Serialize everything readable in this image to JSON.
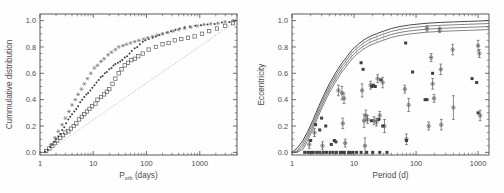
{
  "figure": {
    "background": "#fefefe",
    "panels": [
      "left",
      "right"
    ]
  },
  "chart_data": [
    {
      "type": "line",
      "panel": "left",
      "title": "",
      "xlabel": "P",
      "xlabel_sub": "orb",
      "xlabel_unit": " (days)",
      "xlabel_full": "P_orb (days)",
      "ylabel": "Cummulative distribution",
      "xscale": "log",
      "yscale": "linear",
      "xlim": [
        1,
        5000
      ],
      "ylim": [
        -0.02,
        1.05
      ],
      "xticks": [
        1,
        10,
        100,
        1000
      ],
      "xticklabels": [
        "1",
        "10",
        "100",
        "1000"
      ],
      "yticks": [
        0.0,
        0.2,
        0.4,
        0.6,
        0.8,
        1.0
      ],
      "yticklabels": [
        "0.0",
        "0.2",
        "0.4",
        "0.6",
        "0.8",
        "1.0"
      ],
      "grid": false,
      "legend": "none",
      "annotations": [
        "dotted diagonal reference line from (1.3, 0.0) to (5000, 1.0)"
      ],
      "series": [
        {
          "name": "open-squares",
          "marker": "square-open",
          "x": [
            1.3,
            1.5,
            1.7,
            1.9,
            2.1,
            2.4,
            2.7,
            3.0,
            3.4,
            3.8,
            4.3,
            4.8,
            5.4,
            6.1,
            6.8,
            7.6,
            8.5,
            9.5,
            11,
            12,
            14,
            16,
            18,
            20,
            23,
            26,
            30,
            34,
            39,
            45,
            52,
            60,
            70,
            85,
            110,
            150,
            200,
            260,
            340,
            450,
            600,
            800,
            1100,
            1500,
            2100,
            3000,
            4200
          ],
          "y": [
            0.01,
            0.03,
            0.05,
            0.07,
            0.09,
            0.11,
            0.13,
            0.15,
            0.16,
            0.18,
            0.2,
            0.22,
            0.25,
            0.27,
            0.29,
            0.31,
            0.33,
            0.35,
            0.37,
            0.4,
            0.42,
            0.44,
            0.46,
            0.48,
            0.52,
            0.56,
            0.6,
            0.63,
            0.66,
            0.68,
            0.7,
            0.71,
            0.73,
            0.75,
            0.78,
            0.8,
            0.82,
            0.83,
            0.85,
            0.86,
            0.87,
            0.88,
            0.9,
            0.92,
            0.94,
            0.96,
            0.98
          ]
        },
        {
          "name": "filled-dots",
          "marker": "dot",
          "x": [
            1.25,
            1.4,
            1.55,
            1.7,
            1.85,
            2.0,
            2.2,
            2.4,
            2.6,
            2.85,
            3.1,
            3.4,
            3.7,
            4.0,
            4.4,
            4.8,
            5.2,
            5.7,
            6.2,
            6.8,
            7.4,
            8.0,
            8.8,
            9.6,
            10.5,
            11.5,
            12.6,
            13.8,
            15,
            16.5,
            18,
            20,
            22,
            24,
            26,
            29,
            32,
            35,
            39,
            43,
            48,
            53,
            60,
            67,
            75,
            85,
            95,
            110,
            130,
            150,
            175,
            200,
            240,
            290,
            350,
            420,
            520,
            650,
            820,
            1050,
            1400,
            1900,
            2600,
            3600,
            4600
          ],
          "y": [
            0.005,
            0.02,
            0.04,
            0.06,
            0.08,
            0.1,
            0.12,
            0.14,
            0.17,
            0.19,
            0.22,
            0.25,
            0.27,
            0.29,
            0.31,
            0.33,
            0.35,
            0.38,
            0.4,
            0.42,
            0.44,
            0.45,
            0.47,
            0.49,
            0.51,
            0.53,
            0.55,
            0.57,
            0.58,
            0.6,
            0.61,
            0.63,
            0.64,
            0.66,
            0.67,
            0.68,
            0.69,
            0.7,
            0.72,
            0.73,
            0.75,
            0.77,
            0.79,
            0.8,
            0.82,
            0.84,
            0.85,
            0.86,
            0.87,
            0.88,
            0.89,
            0.9,
            0.91,
            0.92,
            0.93,
            0.94,
            0.95,
            0.955,
            0.96,
            0.965,
            0.97,
            0.975,
            0.985,
            0.99,
            1.0
          ]
        },
        {
          "name": "stars",
          "marker": "star",
          "x": [
            1.6,
            1.9,
            2.2,
            2.6,
            3.0,
            3.5,
            4.0,
            4.6,
            5.2,
            6.0,
            6.8,
            7.8,
            9.0,
            10.5,
            12,
            14,
            16,
            19,
            22,
            26,
            30,
            36,
            42,
            50,
            60,
            72,
            88,
            105,
            130,
            160,
            200,
            250,
            320,
            400,
            520,
            680,
            900,
            1200,
            1600,
            2200,
            3000,
            4200
          ],
          "y": [
            0.06,
            0.11,
            0.16,
            0.21,
            0.26,
            0.31,
            0.36,
            0.4,
            0.44,
            0.48,
            0.52,
            0.56,
            0.6,
            0.64,
            0.66,
            0.69,
            0.71,
            0.74,
            0.76,
            0.78,
            0.8,
            0.81,
            0.82,
            0.83,
            0.84,
            0.85,
            0.86,
            0.87,
            0.88,
            0.89,
            0.9,
            0.91,
            0.92,
            0.93,
            0.94,
            0.95,
            0.96,
            0.97,
            0.975,
            0.98,
            0.99,
            1.0
          ]
        }
      ]
    },
    {
      "type": "scatter",
      "panel": "right",
      "title": "",
      "xlabel": "Period (d)",
      "ylabel": "Eccentricity",
      "xscale": "log",
      "yscale": "linear",
      "xlim": [
        1,
        1500
      ],
      "ylim": [
        -0.02,
        1.05
      ],
      "xticks": [
        1,
        10,
        100,
        1000
      ],
      "xticklabels": [
        "1",
        "10",
        "100",
        "1000"
      ],
      "yticks": [
        0.0,
        0.2,
        0.4,
        0.6,
        0.8,
        1.0
      ],
      "yticklabels": [
        "0.0",
        "0.2",
        "0.4",
        "0.6",
        "0.8",
        "1.0"
      ],
      "grid": false,
      "legend": "none",
      "annotations": [
        "band of ~4 near-parallel circularisation curves rising from (1,0) and asymptoting to e=1"
      ],
      "curve_band": {
        "name": "circularisation-envelope",
        "count": 4,
        "x": [
          1.0,
          1.2,
          1.5,
          1.8,
          2.2,
          2.7,
          3.3,
          4.0,
          5.0,
          6.2,
          7.5,
          9.0,
          11,
          14,
          18,
          23,
          30,
          40,
          55,
          75,
          100,
          150,
          250,
          400,
          700,
          1200,
          1500
        ],
        "y": [
          0.0,
          0.03,
          0.09,
          0.16,
          0.25,
          0.35,
          0.44,
          0.52,
          0.6,
          0.67,
          0.72,
          0.77,
          0.81,
          0.85,
          0.88,
          0.9,
          0.92,
          0.94,
          0.955,
          0.965,
          0.972,
          0.98,
          0.986,
          0.99,
          0.994,
          0.998,
          1.0
        ],
        "offsets": [
          0.0,
          -0.022,
          -0.045,
          -0.068
        ]
      },
      "series": [
        {
          "name": "eccentricity-with-errors",
          "marker": "circle-open-errorbar",
          "points": [
            {
              "x": 1.9,
              "y": 0.06,
              "err": 0.03
            },
            {
              "x": 2.3,
              "y": 0.15,
              "err": 0.03
            },
            {
              "x": 3.1,
              "y": 0.05,
              "err": 0.03
            },
            {
              "x": 5.6,
              "y": 0.47,
              "err": 0.04
            },
            {
              "x": 6.4,
              "y": 0.45,
              "err": 0.05
            },
            {
              "x": 6.9,
              "y": 0.41,
              "err": 0.04
            },
            {
              "x": 6.6,
              "y": 0.22,
              "err": 0.04
            },
            {
              "x": 7.2,
              "y": 0.07,
              "err": 0.03
            },
            {
              "x": 13.5,
              "y": 0.47,
              "err": 0.05
            },
            {
              "x": 14.5,
              "y": 0.24,
              "err": 0.05
            },
            {
              "x": 15.5,
              "y": 0.28,
              "err": 0.04
            },
            {
              "x": 16.5,
              "y": 0.25,
              "err": 0.03
            },
            {
              "x": 15.0,
              "y": 0.05,
              "err": 0.06
            },
            {
              "x": 18.5,
              "y": 0.51,
              "err": 0.03
            },
            {
              "x": 21.0,
              "y": 0.24,
              "err": 0.03
            },
            {
              "x": 23.0,
              "y": 0.23,
              "err": 0.03
            },
            {
              "x": 26.0,
              "y": 0.28,
              "err": 0.03
            },
            {
              "x": 29.0,
              "y": 0.53,
              "err": 0.04
            },
            {
              "x": 31.0,
              "y": 0.2,
              "err": 0.05
            },
            {
              "x": 24.0,
              "y": 0.56,
              "err": 0.03
            },
            {
              "x": 66.0,
              "y": 0.48,
              "err": 0.03
            },
            {
              "x": 70.0,
              "y": 0.1,
              "err": 0.04
            },
            {
              "x": 76.0,
              "y": 0.36,
              "err": 0.05
            },
            {
              "x": 150.0,
              "y": 0.94,
              "err": 0.02
            },
            {
              "x": 175.0,
              "y": 0.72,
              "err": 0.03
            },
            {
              "x": 185.0,
              "y": 0.52,
              "err": 0.04
            },
            {
              "x": 195.0,
              "y": 0.41,
              "err": 0.03
            },
            {
              "x": 160.0,
              "y": 0.2,
              "err": 0.03
            },
            {
              "x": 240.0,
              "y": 0.93,
              "err": 0.02
            },
            {
              "x": 250.0,
              "y": 0.63,
              "err": 0.04
            },
            {
              "x": 255.0,
              "y": 0.21,
              "err": 0.04
            },
            {
              "x": 390.0,
              "y": 0.78,
              "err": 0.04
            },
            {
              "x": 400.0,
              "y": 0.34,
              "err": 0.09
            },
            {
              "x": 1000.0,
              "y": 0.81,
              "err": 0.04
            },
            {
              "x": 1050.0,
              "y": 0.75,
              "err": 0.03
            },
            {
              "x": 1080.0,
              "y": 0.28,
              "err": 0.04
            }
          ]
        },
        {
          "name": "filled-squares",
          "marker": "square-filled",
          "points": [
            {
              "x": 1.6,
              "y": 0.0
            },
            {
              "x": 1.8,
              "y": 0.0
            },
            {
              "x": 2.0,
              "y": 0.0
            },
            {
              "x": 2.2,
              "y": 0.0
            },
            {
              "x": 2.5,
              "y": 0.0
            },
            {
              "x": 2.8,
              "y": 0.0
            },
            {
              "x": 3.2,
              "y": 0.0
            },
            {
              "x": 3.6,
              "y": 0.0
            },
            {
              "x": 4.1,
              "y": 0.0
            },
            {
              "x": 4.6,
              "y": 0.0
            },
            {
              "x": 5.2,
              "y": 0.0
            },
            {
              "x": 6.0,
              "y": 0.0
            },
            {
              "x": 7.0,
              "y": 0.0
            },
            {
              "x": 8.2,
              "y": 0.0
            },
            {
              "x": 9.5,
              "y": 0.0
            },
            {
              "x": 11.0,
              "y": 0.0
            },
            {
              "x": 13.0,
              "y": 0.0
            },
            {
              "x": 16.0,
              "y": 0.0
            },
            {
              "x": 20.0,
              "y": 0.0
            },
            {
              "x": 26.0,
              "y": 0.0
            },
            {
              "x": 34.0,
              "y": 0.0
            },
            {
              "x": 2.0,
              "y": 0.09
            },
            {
              "x": 2.4,
              "y": 0.21
            },
            {
              "x": 2.8,
              "y": 0.17
            },
            {
              "x": 3.0,
              "y": 0.26
            },
            {
              "x": 3.5,
              "y": 0.2
            },
            {
              "x": 4.3,
              "y": 0.06
            },
            {
              "x": 4.8,
              "y": 0.09
            },
            {
              "x": 5.1,
              "y": 0.08
            },
            {
              "x": 6.5,
              "y": 0.0
            },
            {
              "x": 8.5,
              "y": 0.0
            },
            {
              "x": 14.0,
              "y": 0.63
            },
            {
              "x": 13.0,
              "y": 0.68
            },
            {
              "x": 19.5,
              "y": 0.5
            },
            {
              "x": 20.5,
              "y": 0.51
            },
            {
              "x": 22.0,
              "y": 0.5
            },
            {
              "x": 27.0,
              "y": 0.55
            },
            {
              "x": 19.0,
              "y": 0.24
            },
            {
              "x": 25.0,
              "y": 0.25
            },
            {
              "x": 29.0,
              "y": 0.2
            },
            {
              "x": 68.0,
              "y": 0.83
            },
            {
              "x": 70.0,
              "y": 0.09
            },
            {
              "x": 88.0,
              "y": 0.61
            },
            {
              "x": 140.0,
              "y": 0.4
            },
            {
              "x": 150.0,
              "y": 0.4
            },
            {
              "x": 185.0,
              "y": 0.6
            },
            {
              "x": 800.0,
              "y": 0.56
            },
            {
              "x": 950.0,
              "y": 0.53
            },
            {
              "x": 1000.0,
              "y": 0.3
            }
          ]
        }
      ]
    }
  ]
}
